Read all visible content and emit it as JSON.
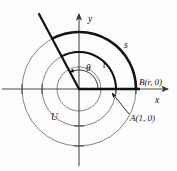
{
  "figure": {
    "type": "math-diagram",
    "axes": {
      "x_label": "x",
      "y_label": "y",
      "x_axis_name": "x-axis",
      "y_axis_name": "y-axis"
    },
    "labels": {
      "angle": "θ",
      "arc_outer": "s",
      "arc_inner": "t",
      "unit_region": "U",
      "point_a": "A(1, 0)",
      "point_b": "B(r, 0)"
    },
    "geometry": {
      "origin": [
        79,
        89
      ],
      "circle_radii": [
        22,
        37,
        57
      ],
      "ray_angle_degrees": 118,
      "arc_start_degrees": 0,
      "arc_end_degrees": 118,
      "point_a_x": 116,
      "point_b_x": 136
    },
    "colors": {
      "stroke_bold": "#111111",
      "stroke_thin": "#6b6b6b",
      "axis": "#4a4a4a",
      "background": "#fdfdfd"
    }
  }
}
